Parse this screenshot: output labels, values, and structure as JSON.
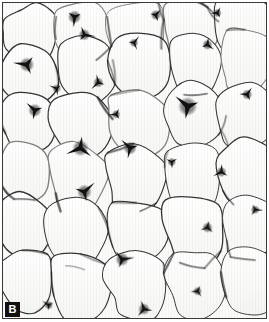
{
  "figure": {
    "domain": "histology-micrograph",
    "panel_label": "B",
    "caption_text": "",
    "width_px": 269,
    "height_px": 322
  },
  "image": {
    "subject": "adipose tissue (white fat) histological section",
    "stain": "hematoxylin-and-eosin",
    "description": "Dense field of large polygonal unilocular adipocytes with thin dark cell membranes and pale empty cytoplasm; dark triangular interstitial nodes where three or more cells meet.",
    "colors": {
      "cell_interior": "#fbfbf9",
      "membrane_line": "#2b2b2b",
      "membrane_line_light": "#9a9a9a",
      "junction_node": "#111111",
      "frame_border": "#3a3a3a",
      "page_background": "#ffffff",
      "label_background": "#111111",
      "label_text": "#ffffff"
    }
  },
  "cells": {
    "count_visible": 46,
    "membrane_stroke_width_px": 1.1,
    "polygons": [
      {
        "name": "cell-r1-c1",
        "points": "0,14 16,4 38,2 52,14 54,36 44,54 22,60 6,50 -2,32"
      },
      {
        "name": "cell-r1-c2",
        "points": "54,6 74,0 96,2 108,16 106,40 92,56 70,58 56,44 52,22"
      },
      {
        "name": "cell-r1-c3",
        "points": "110,6 132,0 154,4 164,20 160,44 146,58 122,58 110,44 106,24"
      },
      {
        "name": "cell-r1-c4",
        "points": "166,2 188,-2 208,4 216,20 212,40 198,52 176,52 164,38 162,18"
      },
      {
        "name": "cell-r1-c5",
        "points": "218,0 240,-4 262,2 270,18 266,38 252,50 230,50 218,36 214,16"
      },
      {
        "name": "cell-r2-c1",
        "points": "2,54 20,44 44,46 56,60 58,84 46,100 22,104 6,92 -2,74"
      },
      {
        "name": "cell-r2-c2",
        "points": "60,42 82,36 104,42 114,58 112,84 98,100 74,100 60,84 54,62"
      },
      {
        "name": "cell-r2-c3",
        "points": "114,36 140,30 162,38 170,56 166,82 150,98 126,96 114,80 108,56"
      },
      {
        "name": "cell-r2-c4",
        "points": "172,34 194,28 214,36 222,54 218,78 204,92 182,90 170,74 166,52"
      },
      {
        "name": "cell-r2-c5",
        "points": "224,30 246,26 266,34 272,52 268,76 254,90 232,88 222,72 218,50"
      },
      {
        "name": "cell-r3-c1",
        "points": "0,96 18,88 40,92 50,108 48,132 36,146 14,148 2,134 -4,114"
      },
      {
        "name": "cell-r3-c2",
        "points": "52,96 76,90 98,98 108,116 104,142 88,156 64,152 52,134 46,112"
      },
      {
        "name": "cell-r3-c3",
        "points": "110,92 136,86 158,96 166,116 160,140 144,154 120,150 110,132 104,110"
      },
      {
        "name": "cell-r3-c4",
        "points": "168,86 192,80 214,90 222,110 216,134 200,148 178,144 168,126 164,104"
      },
      {
        "name": "cell-r3-c5",
        "points": "224,84 248,78 268,88 274,108 268,132 252,146 230,142 222,124 218,102"
      },
      {
        "name": "cell-r4-c1",
        "points": "0,146 16,138 38,144 48,160 46,186 32,200 10,198 0,184 -6,164"
      },
      {
        "name": "cell-r4-c2",
        "points": "50,148 74,142 96,152 106,172 100,198 84,212 60,208 50,190 44,166"
      },
      {
        "name": "cell-r4-c3",
        "points": "108,150 132,144 154,154 162,174 156,198 140,212 116,208 108,190 102,168"
      },
      {
        "name": "cell-r4-c4",
        "points": "164,146 190,140 212,150 220,170 214,196 198,210 174,206 164,188 160,164"
      },
      {
        "name": "cell-r4-c5",
        "points": "222,144 246,138 268,148 274,168 268,194 252,208 230,204 220,186 216,162"
      },
      {
        "name": "cell-r5-c1",
        "points": "0,200 18,192 40,200 48,218 44,242 30,256 8,252 -2,236 -8,216"
      },
      {
        "name": "cell-r5-c2",
        "points": "52,202 76,196 98,206 106,226 100,252 84,266 60,262 50,244 44,220"
      },
      {
        "name": "cell-r5-c3",
        "points": "108,204 134,198 156,208 164,228 158,252 142,266 118,262 108,244 102,222"
      },
      {
        "name": "cell-r5-c4",
        "points": "166,200 192,194 214,204 222,224 216,250 200,264 176,260 166,242 162,218"
      },
      {
        "name": "cell-r5-c5",
        "points": "224,198 250,192 270,202 276,222 270,248 254,262 232,258 222,240 218,216"
      },
      {
        "name": "cell-r6-c1",
        "points": "0,254 20,246 42,254 50,272 46,296 32,310 10,306 0,290 -8,270"
      },
      {
        "name": "cell-r6-c2",
        "points": "52,256 78,250 100,260 108,280 102,306 86,320 62,316 52,298 46,274"
      },
      {
        "name": "cell-r6-c3",
        "points": "110,258 136,252 158,262 166,282 160,306 144,320 120,316 110,298 104,276"
      },
      {
        "name": "cell-r6-c4",
        "points": "168,254 194,248 216,258 224,278 218,304 202,318 178,314 168,296 164,272"
      },
      {
        "name": "cell-r6-c5",
        "points": "226,252 252,246 272,256 278,276 272,302 256,316 234,312 224,294 220,270"
      }
    ],
    "junction_nodes": [
      {
        "name": "node-1",
        "x": 72,
        "y": 14,
        "r": 4.5
      },
      {
        "name": "node-2",
        "x": 154,
        "y": 12,
        "r": 3.5
      },
      {
        "name": "node-3",
        "x": 216,
        "y": 10,
        "r": 3.0
      },
      {
        "name": "node-4",
        "x": 24,
        "y": 62,
        "r": 5.0
      },
      {
        "name": "node-5",
        "x": 82,
        "y": 32,
        "r": 4.0
      },
      {
        "name": "node-6",
        "x": 132,
        "y": 40,
        "r": 3.0
      },
      {
        "name": "node-7",
        "x": 206,
        "y": 42,
        "r": 3.5
      },
      {
        "name": "node-8",
        "x": 54,
        "y": 86,
        "r": 3.0
      },
      {
        "name": "node-9",
        "x": 96,
        "y": 80,
        "r": 3.5
      },
      {
        "name": "node-10",
        "x": 186,
        "y": 104,
        "r": 6.5
      },
      {
        "name": "node-11",
        "x": 32,
        "y": 108,
        "r": 4.5
      },
      {
        "name": "node-12",
        "x": 114,
        "y": 112,
        "r": 3.0
      },
      {
        "name": "node-13",
        "x": 246,
        "y": 92,
        "r": 3.5
      },
      {
        "name": "node-14",
        "x": 78,
        "y": 146,
        "r": 5.5
      },
      {
        "name": "node-15",
        "x": 128,
        "y": 146,
        "r": 4.5
      },
      {
        "name": "node-16",
        "x": 170,
        "y": 160,
        "r": 3.0
      },
      {
        "name": "node-17",
        "x": 82,
        "y": 190,
        "r": 5.0
      },
      {
        "name": "node-18",
        "x": 220,
        "y": 170,
        "r": 3.5
      },
      {
        "name": "node-19",
        "x": 120,
        "y": 258,
        "r": 4.5
      },
      {
        "name": "node-20",
        "x": 206,
        "y": 226,
        "r": 3.5
      },
      {
        "name": "node-21",
        "x": 196,
        "y": 290,
        "r": 3.0
      },
      {
        "name": "node-22",
        "x": 142,
        "y": 308,
        "r": 4.0
      },
      {
        "name": "node-23",
        "x": 46,
        "y": 304,
        "r": 3.0
      },
      {
        "name": "node-24",
        "x": 254,
        "y": 208,
        "r": 3.0
      }
    ]
  }
}
